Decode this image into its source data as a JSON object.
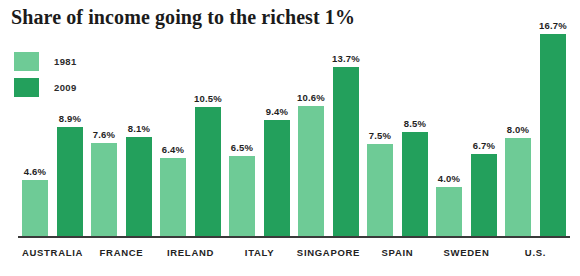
{
  "chart_data": {
    "type": "bar",
    "title": "Share of income going to the richest 1%",
    "xlabel": "",
    "ylabel": "",
    "ylim": [
      0,
      17.5
    ],
    "grid": false,
    "legend_position": "top-left",
    "value_suffix": "%",
    "categories": [
      "AUSTRALIA",
      "FRANCE",
      "IRELAND",
      "ITALY",
      "SINGAPORE",
      "SPAIN",
      "SWEDEN",
      "U.S."
    ],
    "series": [
      {
        "name": "1981",
        "color": "#6ecb96",
        "values": [
          4.6,
          7.6,
          6.4,
          6.5,
          10.6,
          7.5,
          4.0,
          8.0
        ],
        "labels": [
          "4.6%",
          "7.6%",
          "6.4%",
          "6.5%",
          "10.6%",
          "7.5%",
          "4.0%",
          "8.0%"
        ]
      },
      {
        "name": "2009",
        "color": "#23a05c",
        "values": [
          8.9,
          8.1,
          10.5,
          9.4,
          13.7,
          8.5,
          6.7,
          16.7
        ],
        "labels": [
          "8.9%",
          "8.1%",
          "10.5%",
          "9.4%",
          "13.7%",
          "8.5%",
          "6.7%",
          "16.7%"
        ]
      }
    ]
  },
  "legend": [
    {
      "label": "1981",
      "color": "#6ecb96"
    },
    {
      "label": "2009",
      "color": "#23a05c"
    }
  ],
  "colors": {
    "series_1981": "#6ecb96",
    "series_2009": "#23a05c",
    "axis": "#3a3a3a",
    "text": "#1b1b1b",
    "background": "#ffffff"
  }
}
